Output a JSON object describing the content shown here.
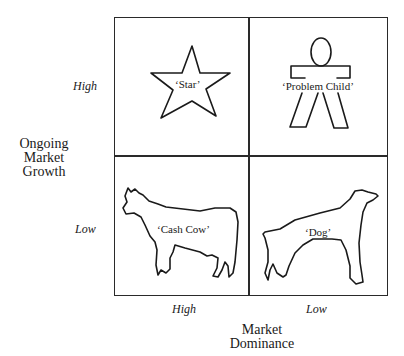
{
  "matrix": {
    "y_axis": {
      "title_lines": [
        "Ongoing",
        "Market",
        "Growth"
      ],
      "ticks": [
        "High",
        "Low"
      ]
    },
    "x_axis": {
      "title_lines": [
        "Market",
        "Dominance"
      ],
      "ticks": [
        "High",
        "Low"
      ]
    },
    "quadrants": [
      {
        "position": "top-left",
        "label": "‘Star’",
        "icon": "star-icon"
      },
      {
        "position": "top-right",
        "label": "‘Problem Child’",
        "icon": "child-figure-icon"
      },
      {
        "position": "bottom-left",
        "label": "‘Cash Cow’",
        "icon": "cow-icon"
      },
      {
        "position": "bottom-right",
        "label": "‘Dog’",
        "icon": "dog-icon"
      }
    ]
  }
}
